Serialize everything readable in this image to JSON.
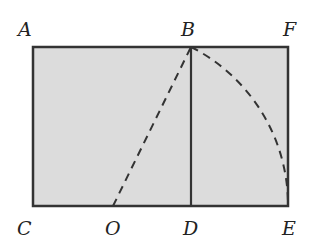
{
  "diagram": {
    "type": "golden-rectangle-construction",
    "colors": {
      "fill": "#dcdcdc",
      "stroke": "#333333",
      "label": "#222222"
    },
    "points": {
      "A": {
        "label": "A",
        "x": 33,
        "y": 47
      },
      "B": {
        "label": "B",
        "x": 191,
        "y": 47
      },
      "F": {
        "label": "F",
        "x": 288,
        "y": 47
      },
      "C": {
        "label": "C",
        "x": 33,
        "y": 206
      },
      "O": {
        "label": "O",
        "x": 113,
        "y": 206
      },
      "D": {
        "label": "D",
        "x": 191,
        "y": 206
      },
      "E": {
        "label": "E",
        "x": 288,
        "y": 206
      }
    },
    "segments": [
      {
        "from": "A",
        "to": "F",
        "style": "solid"
      },
      {
        "from": "F",
        "to": "E",
        "style": "solid"
      },
      {
        "from": "E",
        "to": "C",
        "style": "solid"
      },
      {
        "from": "C",
        "to": "A",
        "style": "solid"
      },
      {
        "from": "B",
        "to": "D",
        "style": "solid"
      },
      {
        "from": "O",
        "to": "B",
        "style": "dashed"
      }
    ],
    "arcs": [
      {
        "center": "O",
        "from": "B",
        "to": "E",
        "style": "dashed"
      }
    ]
  }
}
